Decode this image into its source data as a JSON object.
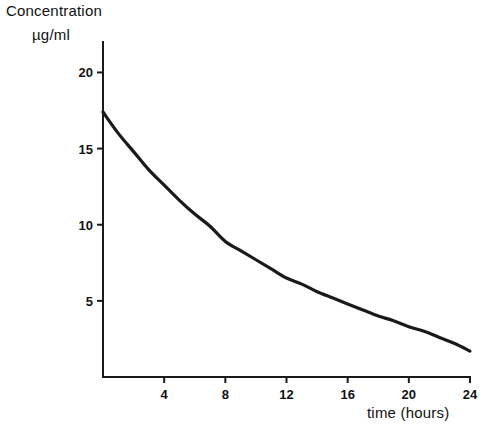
{
  "chart_data": {
    "type": "line",
    "title": "",
    "ylabel": "Concentration",
    "ylabel_units": "µg/ml",
    "xlabel": "time (hours)",
    "xlim": [
      0,
      24
    ],
    "ylim": [
      0,
      22
    ],
    "grid": false,
    "legend": null,
    "line_color": "#1a1a1a",
    "xticks": [
      {
        "value": 4,
        "label": "4"
      },
      {
        "value": 8,
        "label": "8"
      },
      {
        "value": 12,
        "label": "12"
      },
      {
        "value": 16,
        "label": "16"
      },
      {
        "value": 20,
        "label": "20"
      },
      {
        "value": 24,
        "label": "24"
      }
    ],
    "yticks": [
      {
        "value": 5,
        "label": "5"
      },
      {
        "value": 10,
        "label": "10"
      },
      {
        "value": 15,
        "label": "15"
      },
      {
        "value": 20,
        "label": "20"
      }
    ],
    "series": [
      {
        "name": "plasma concentration",
        "x": [
          0,
          1,
          2,
          3,
          4,
          5,
          6,
          7,
          8,
          9,
          10,
          11,
          12,
          13,
          14,
          15,
          16,
          17,
          18,
          19,
          20,
          21,
          22,
          23,
          24
        ],
        "values": [
          17.4,
          16.0,
          14.8,
          13.6,
          12.6,
          11.6,
          10.7,
          9.9,
          8.9,
          8.3,
          7.7,
          7.1,
          6.5,
          6.1,
          5.6,
          5.2,
          4.8,
          4.4,
          4.0,
          3.7,
          3.3,
          3.0,
          2.6,
          2.2,
          1.7
        ]
      }
    ]
  },
  "axes_geometry": {
    "origin_x": 103,
    "origin_y": 377,
    "x_end": 470,
    "y_top": 42
  }
}
